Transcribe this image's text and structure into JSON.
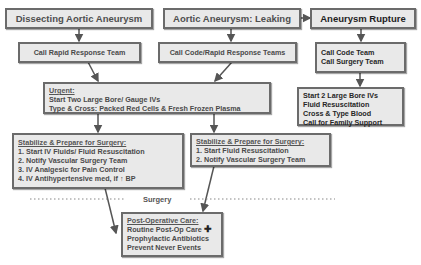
{
  "columns": {
    "dissecting": {
      "title": "Dissecting Aortic Aneurysm",
      "response": "Call Rapid Response Team"
    },
    "leaking": {
      "title": "Aortic Aneurysm: Leaking",
      "response": "Call Code/Rapid Response Teams"
    },
    "rupture": {
      "title": "Aneurysm Rupture",
      "response": [
        "Call Code Team",
        "Call Surgery Team"
      ],
      "actions": [
        "Start 2 Large Bore IVs",
        "Fluid Resuscitation",
        "Cross & Type Blood",
        "Call for Family Support"
      ]
    }
  },
  "urgent": {
    "header": "Urgent:",
    "lines": [
      "Start Two Large Bore/ Gauge IVs",
      "Type & Cross: Packed Red Cells & Fresh Frozen Plasma"
    ]
  },
  "stabilize_left": {
    "header": "Stabilize & Prepare for Surgery:",
    "lines": [
      "1. Start IV Fluids/ Fluid Resuscitation",
      "2. Notify Vascular Surgery Team",
      "3. IV Analgesic for Pain Control",
      "4. IV Antihypertensive med, if ↑ BP"
    ]
  },
  "stabilize_mid": {
    "header": "Stabilize & Prepare for Surgery:",
    "lines": [
      "1. Start Fluid Resuscitation",
      "2. Notify Vascular Surgery Team"
    ]
  },
  "surgery_label": "Surgery",
  "postop": {
    "header": "Post-Operative Care:",
    "lines": [
      "Routine Post-Op Care",
      "Prophylactic Antibiotics",
      "Prevent Never Events"
    ],
    "plus_icon": "✚"
  }
}
